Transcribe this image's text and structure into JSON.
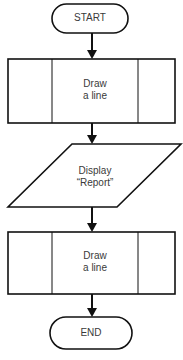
{
  "flowchart": {
    "nodes": [
      {
        "id": "start",
        "shape": "terminator",
        "label": "START"
      },
      {
        "id": "draw1",
        "shape": "predefined-process",
        "label_line1": "Draw",
        "label_line2": "a line"
      },
      {
        "id": "display",
        "shape": "input-output",
        "label_line1": "Display",
        "label_line2": "“Report”"
      },
      {
        "id": "draw2",
        "shape": "predefined-process",
        "label_line1": "Draw",
        "label_line2": "a line"
      },
      {
        "id": "end",
        "shape": "terminator",
        "label": "END"
      }
    ],
    "edges": [
      {
        "from": "start",
        "to": "draw1"
      },
      {
        "from": "draw1",
        "to": "display"
      },
      {
        "from": "display",
        "to": "draw2"
      },
      {
        "from": "draw2",
        "to": "end"
      }
    ],
    "colors": {
      "stroke": "#111111",
      "text": "#3a3a3a",
      "background": "#ffffff"
    }
  }
}
